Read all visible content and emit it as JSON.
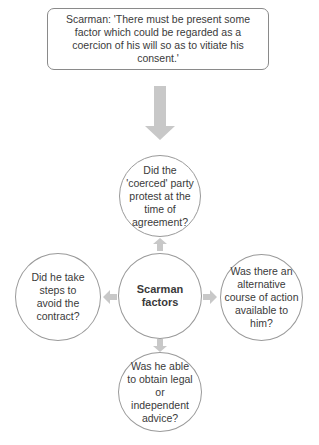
{
  "quote": {
    "text": "Scarman: 'There must be present some factor which could be regarded as a coercion of his will so as to vitiate his consent.'"
  },
  "center": {
    "label": "Scarman factors"
  },
  "factors": {
    "top": "Did the 'coerced' party protest at the time of agreement?",
    "right": "Was there an alternative course of action available to him?",
    "bottom": "Was he able to obtain legal or independent advice?",
    "left": "Did he take steps to avoid the contract?"
  },
  "colors": {
    "arrow": "#c8c8c8",
    "border": "#9a9a9a",
    "text": "#3a3a3a"
  }
}
